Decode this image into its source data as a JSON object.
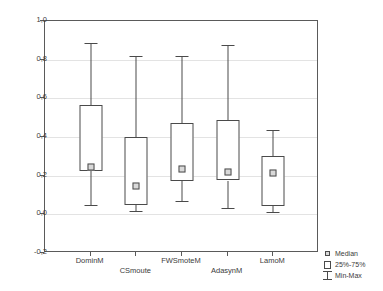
{
  "chart_data": {
    "type": "box",
    "title": "",
    "xlabel": "",
    "ylabel": "",
    "ylim": [
      -0.2,
      1.0
    ],
    "ytick_labels": [
      "1,0",
      "0,8",
      "0,6",
      "0,4",
      "0,2",
      "0,0",
      "-0,2"
    ],
    "ytick_values": [
      1.0,
      0.8,
      0.6,
      0.4,
      0.2,
      0.0,
      -0.2
    ],
    "grid": true,
    "decimal_separator": ",",
    "categories": [
      "DominM",
      "CSmoute",
      "FWSmoteM",
      "AdasynM",
      "LamoM"
    ],
    "boxes": [
      {
        "label": "DominM",
        "min": 0.05,
        "q1": 0.225,
        "median": 0.245,
        "q3": 0.565,
        "max": 0.885
      },
      {
        "label": "CSmoute",
        "min": 0.015,
        "q1": 0.05,
        "median": 0.145,
        "q3": 0.4,
        "max": 0.82
      },
      {
        "label": "FWSmoteM",
        "min": 0.07,
        "q1": 0.17,
        "median": 0.235,
        "q3": 0.47,
        "max": 0.82
      },
      {
        "label": "AdasynM",
        "min": 0.035,
        "q1": 0.175,
        "median": 0.22,
        "q3": 0.49,
        "max": 0.875
      },
      {
        "label": "LamoM",
        "min": 0.01,
        "q1": 0.045,
        "median": 0.215,
        "q3": 0.3,
        "max": 0.435
      }
    ],
    "legend": {
      "position": "bottom-right",
      "entries": [
        {
          "key": "median",
          "label": "Median"
        },
        {
          "key": "iqr",
          "label": "25%-75%"
        },
        {
          "key": "minmax",
          "label": "Min-Max"
        }
      ]
    },
    "colors": {
      "frame": "#5a5a5a",
      "grid": "#e3e3e3",
      "line": "#4a4a4a",
      "median_fill": "#d9d9d9",
      "text": "#3b3b3b",
      "background": "#ffffff"
    }
  }
}
